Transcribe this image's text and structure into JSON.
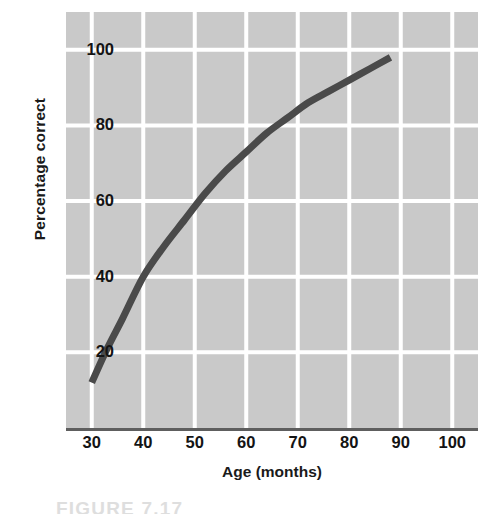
{
  "figure": {
    "background_color": "#ffffff",
    "caption_cutoff_text": "FIGURE 7.17"
  },
  "chart_data": {
    "type": "line",
    "title": "",
    "subtitle": "",
    "xlabel": "Age (months)",
    "ylabel": "Percentage correct",
    "xlim": [
      25,
      105
    ],
    "ylim": [
      0,
      110
    ],
    "xticks": [
      30,
      40,
      50,
      60,
      70,
      80,
      90,
      100
    ],
    "xtick_labels": [
      "30",
      "40",
      "50",
      "60",
      "70",
      "80",
      "90",
      "100"
    ],
    "yticks": [
      20,
      40,
      60,
      80,
      100
    ],
    "ytick_labels": [
      "20",
      "40",
      "60",
      "80",
      "100"
    ],
    "grid": true,
    "grid_color": "#ffffff",
    "plot_background_color": "#c9c9c9",
    "legend": null,
    "legend_position": "none",
    "annotations": [],
    "series": [
      {
        "name": "Percentage correct by age",
        "color": "#4a4a4a",
        "line_width": 7,
        "x": [
          30,
          33,
          36,
          40,
          44,
          48,
          52,
          56,
          60,
          64,
          68,
          72,
          76,
          80,
          84,
          88
        ],
        "y": [
          12,
          21,
          29,
          40,
          48,
          55,
          62,
          68,
          73,
          78,
          82,
          86,
          89,
          92,
          95,
          98
        ]
      }
    ]
  },
  "axes": {
    "x_axis_line_color": "#5e5e5e",
    "tick_label_color": "#141414",
    "axis_title_color": "#1a1a1a"
  }
}
